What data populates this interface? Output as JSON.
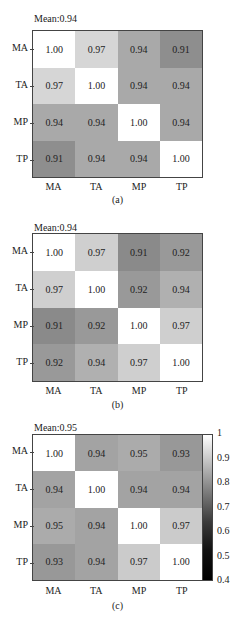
{
  "chart_data": [
    {
      "type": "heatmap",
      "title": "Mean:0.94",
      "caption": "(a)",
      "row_labels": [
        "MA",
        "TA",
        "MP",
        "TP"
      ],
      "col_labels": [
        "MA",
        "TA",
        "MP",
        "TP"
      ],
      "values": [
        [
          1.0,
          0.97,
          0.94,
          0.91
        ],
        [
          0.97,
          1.0,
          0.94,
          0.94
        ],
        [
          0.94,
          0.94,
          1.0,
          0.94
        ],
        [
          0.91,
          0.94,
          0.94,
          1.0
        ]
      ],
      "value_labels": [
        [
          "1.00",
          "0.97",
          "0.94",
          "0.91"
        ],
        [
          "0.97",
          "1.00",
          "0.94",
          "0.94"
        ],
        [
          "0.94",
          "0.94",
          "1.00",
          "0.94"
        ],
        [
          "0.91",
          "0.94",
          "0.94",
          "1.00"
        ]
      ],
      "cell_colors": [
        [
          "#ffffff",
          "#d6d6d6",
          "#a9a9a9",
          "#8e8e8e"
        ],
        [
          "#d6d6d6",
          "#ffffff",
          "#a9a9a9",
          "#a9a9a9"
        ],
        [
          "#a9a9a9",
          "#a9a9a9",
          "#ffffff",
          "#a9a9a9"
        ],
        [
          "#8e8e8e",
          "#a9a9a9",
          "#a9a9a9",
          "#ffffff"
        ]
      ]
    },
    {
      "type": "heatmap",
      "title": "Mean:0.94",
      "caption": "(b)",
      "row_labels": [
        "MA",
        "TA",
        "MP",
        "TP"
      ],
      "col_labels": [
        "MA",
        "TA",
        "MP",
        "TP"
      ],
      "values": [
        [
          1.0,
          0.97,
          0.91,
          0.92
        ],
        [
          0.97,
          1.0,
          0.92,
          0.94
        ],
        [
          0.91,
          0.92,
          1.0,
          0.97
        ],
        [
          0.92,
          0.94,
          0.97,
          1.0
        ]
      ],
      "value_labels": [
        [
          "1.00",
          "0.97",
          "0.91",
          "0.92"
        ],
        [
          "0.97",
          "1.00",
          "0.92",
          "0.94"
        ],
        [
          "0.91",
          "0.92",
          "1.00",
          "0.97"
        ],
        [
          "0.92",
          "0.94",
          "0.97",
          "1.00"
        ]
      ],
      "cell_colors": [
        [
          "#ffffff",
          "#cfcfcf",
          "#8a8a8a",
          "#999999"
        ],
        [
          "#cfcfcf",
          "#ffffff",
          "#999999",
          "#b0b0b0"
        ],
        [
          "#8a8a8a",
          "#999999",
          "#ffffff",
          "#cfcfcf"
        ],
        [
          "#999999",
          "#b0b0b0",
          "#cfcfcf",
          "#ffffff"
        ]
      ]
    },
    {
      "type": "heatmap",
      "title": "Mean:0.95",
      "caption": "(c)",
      "row_labels": [
        "MA",
        "TA",
        "MP",
        "TP"
      ],
      "col_labels": [
        "MA",
        "TA",
        "MP",
        "TP"
      ],
      "values": [
        [
          1.0,
          0.94,
          0.95,
          0.93
        ],
        [
          0.94,
          1.0,
          0.94,
          0.94
        ],
        [
          0.95,
          0.94,
          1.0,
          0.97
        ],
        [
          0.93,
          0.94,
          0.97,
          1.0
        ]
      ],
      "value_labels": [
        [
          "1.00",
          "0.94",
          "0.95",
          "0.93"
        ],
        [
          "0.94",
          "1.00",
          "0.94",
          "0.94"
        ],
        [
          "0.95",
          "0.94",
          "1.00",
          "0.97"
        ],
        [
          "0.93",
          "0.94",
          "0.97",
          "1.00"
        ]
      ],
      "cell_colors": [
        [
          "#ffffff",
          "#a3a3a3",
          "#ababab",
          "#989898"
        ],
        [
          "#a3a3a3",
          "#ffffff",
          "#a3a3a3",
          "#a3a3a3"
        ],
        [
          "#ababab",
          "#a3a3a3",
          "#ffffff",
          "#cbcbcb"
        ],
        [
          "#989898",
          "#a3a3a3",
          "#cbcbcb",
          "#ffffff"
        ]
      ],
      "colorbar": {
        "ticks": [
          "1",
          "0.9",
          "0.8",
          "0.7",
          "0.6",
          "0.5",
          "0.4"
        ],
        "range": [
          0.4,
          1.0
        ],
        "colormap": "gray"
      }
    }
  ]
}
